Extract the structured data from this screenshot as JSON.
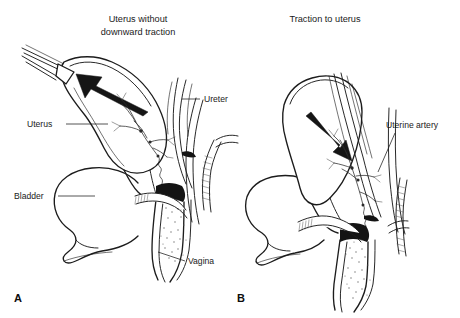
{
  "figure": {
    "background_color": "#ffffff",
    "ink_color": "#1c1c1c",
    "width": 460,
    "height": 318
  },
  "panels": [
    {
      "letter": "A",
      "title_line_1": "Uterus without",
      "title_line_2": "downward traction",
      "arrow_direction": "up-left",
      "labels": [
        {
          "name": "uterus",
          "text": "Uterus"
        },
        {
          "name": "ureter",
          "text": "Ureter"
        },
        {
          "name": "bladder",
          "text": "Bladder"
        },
        {
          "name": "vagina",
          "text": "Vagina"
        }
      ]
    },
    {
      "letter": "B",
      "title_line_1": "Traction to uterus",
      "title_line_2": "",
      "arrow_direction": "down-right",
      "labels": [
        {
          "name": "uterine-artery",
          "text": "Uterine artery"
        }
      ]
    }
  ]
}
